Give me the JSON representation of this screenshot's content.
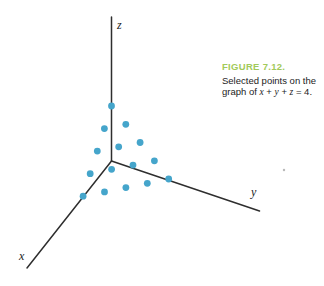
{
  "caption": {
    "figure_label": "FIGURE 7.12.",
    "line1": "Selected points on the",
    "line2_parts": {
      "pre": "graph of ",
      "v1": "x",
      "p1": " + ",
      "v2": "y",
      "p2": " + ",
      "v3": "z",
      "eq": " = 4."
    }
  },
  "colors": {
    "point": "#45a5cb",
    "axis": "#2e2e2e",
    "figure_label_green": "#a2ca5a",
    "caption_text": "#1c1c1c",
    "stray_mark": "#9a9a9a"
  },
  "chart_data": {
    "type": "scatter",
    "title": "FIGURE 7.12. Selected points on the graph of x + y + z = 4",
    "equation": "x + y + z = 4",
    "axis_labels": {
      "x": "x",
      "y": "y",
      "z": "z"
    },
    "grid": false,
    "legend": "none",
    "points": [
      {
        "x": 0,
        "y": 0,
        "z": 4
      },
      {
        "x": 1,
        "y": 0,
        "z": 3
      },
      {
        "x": 0,
        "y": 1,
        "z": 3
      },
      {
        "x": 2,
        "y": 0,
        "z": 2
      },
      {
        "x": 1,
        "y": 1,
        "z": 2
      },
      {
        "x": 0,
        "y": 2,
        "z": 2
      },
      {
        "x": 3,
        "y": 0,
        "z": 1
      },
      {
        "x": 2,
        "y": 1,
        "z": 1
      },
      {
        "x": 1,
        "y": 2,
        "z": 1
      },
      {
        "x": 0,
        "y": 3,
        "z": 1
      },
      {
        "x": 4,
        "y": 0,
        "z": 0
      },
      {
        "x": 3,
        "y": 1,
        "z": 0
      },
      {
        "x": 2,
        "y": 2,
        "z": 0
      },
      {
        "x": 1,
        "y": 3,
        "z": 0
      },
      {
        "x": 0,
        "y": 4,
        "z": 0
      }
    ],
    "point_radius": 3.4,
    "point_color": "#45a5cb",
    "projection": {
      "origin": [
        111.5,
        161
      ],
      "x_dir": [
        -7.1,
        8.8
      ],
      "y_dir": [
        14.3,
        4.5
      ],
      "z_dir": [
        0,
        -13.75
      ]
    }
  }
}
